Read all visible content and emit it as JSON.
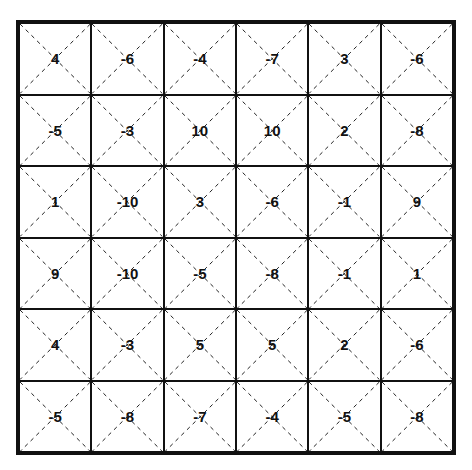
{
  "grid": {
    "rows": 6,
    "cols": 6,
    "values": [
      [
        "4",
        "-6",
        "-4",
        "-7",
        "3",
        "-6"
      ],
      [
        "-5",
        "-3",
        "10",
        "10",
        "2",
        "-8"
      ],
      [
        "1",
        "-10",
        "3",
        "-6",
        "-1",
        "9"
      ],
      [
        "9",
        "-10",
        "-5",
        "-8",
        "-1",
        "1"
      ],
      [
        "4",
        "-3",
        "5",
        "5",
        "2",
        "-6"
      ],
      [
        "-5",
        "-8",
        "-7",
        "-4",
        "-5",
        "-8"
      ]
    ]
  }
}
